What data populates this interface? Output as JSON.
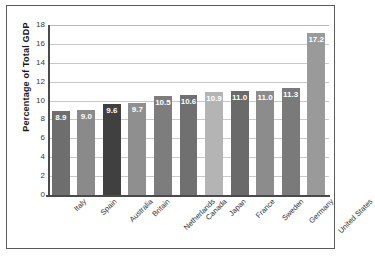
{
  "chart_data": {
    "type": "bar",
    "title": "",
    "xlabel": "",
    "ylabel": "Percentage of Total GDP",
    "ylim": [
      0,
      18
    ],
    "ytick_step": 2,
    "yticks": [
      0,
      2,
      4,
      6,
      8,
      10,
      12,
      14,
      16,
      18
    ],
    "grid": true,
    "grid_axis": "y",
    "legend": "none",
    "value_labels_inside_bars": true,
    "categories": [
      "Italy",
      "Spain",
      "Australia",
      "Britain",
      "Netherlands",
      "Canada",
      "Japan",
      "France",
      "Sweden",
      "Germany",
      "United States"
    ],
    "values": [
      8.9,
      9.0,
      9.6,
      9.7,
      10.5,
      10.6,
      10.9,
      11.0,
      11.0,
      11.3,
      17.2
    ],
    "value_labels": [
      "8.9",
      "9.0",
      "9.6",
      "9.7",
      "10.5",
      "10.6",
      "10.9",
      "11.0",
      "11.0",
      "11.3",
      "17.2"
    ],
    "bar_colors": [
      "#6e6e6e",
      "#8a8a8a",
      "#404040",
      "#8f8f8f",
      "#7d7d7d",
      "#707070",
      "#b4b4b4",
      "#6a6a6a",
      "#8c8c8c",
      "#7a7a7a",
      "#9a9a9a"
    ]
  },
  "axis": {
    "y_title": "Percentage of Total GDP",
    "y_tick_labels": [
      "18",
      "16",
      "14",
      "12",
      "10",
      "8",
      "6",
      "4",
      "2",
      "0"
    ]
  },
  "colors": {
    "frame_border": "#5a5a5a",
    "axis_line": "#4a4a4a",
    "gridline": "#c9c9c9",
    "label_text": "#2f2f2f",
    "value_text": "#ffffff",
    "background": "#ffffff"
  }
}
